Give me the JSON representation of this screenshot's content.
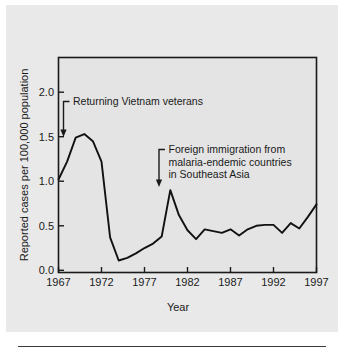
{
  "figure": {
    "background_color": "#e9e9e9",
    "plot_background_color": "#e4e4e4",
    "line_color": "#111111",
    "axis_color": "#1a1a1a"
  },
  "chart_data": {
    "type": "line",
    "title": "",
    "xlabel": "Year",
    "ylabel": "Reported cases per 100,000 population",
    "xlim": [
      1967,
      1997
    ],
    "ylim": [
      0.0,
      2.35
    ],
    "grid": false,
    "legend": null,
    "xticks": [
      "1967",
      "1972",
      "1977",
      "1982",
      "1987",
      "1992",
      "1997"
    ],
    "xtick_values": [
      1967,
      1972,
      1977,
      1982,
      1987,
      1992,
      1997
    ],
    "yticks": [
      "0.0",
      "0.5",
      "1.0",
      "1.5",
      "2.0"
    ],
    "ytick_values": [
      0.0,
      0.5,
      1.0,
      1.5,
      2.0
    ],
    "x": [
      1967,
      1968,
      1969,
      1970,
      1971,
      1972,
      1973,
      1974,
      1975,
      1976,
      1977,
      1978,
      1979,
      1980,
      1981,
      1982,
      1983,
      1984,
      1985,
      1986,
      1987,
      1988,
      1989,
      1990,
      1991,
      1992,
      1993,
      1994,
      1995,
      1996,
      1997
    ],
    "values": [
      1.02,
      1.22,
      1.49,
      1.53,
      1.45,
      1.22,
      0.37,
      0.11,
      0.14,
      0.19,
      0.25,
      0.3,
      0.38,
      0.9,
      0.62,
      0.45,
      0.35,
      0.46,
      0.44,
      0.42,
      0.46,
      0.39,
      0.46,
      0.5,
      0.51,
      0.51,
      0.42,
      0.53,
      0.47,
      0.6,
      0.74
    ],
    "annotations": [
      {
        "id": "returning-vietnam-veterans",
        "lines": [
          "Returning Vietnam veterans"
        ],
        "target_x": 1967.6,
        "target_y": 1.36
      },
      {
        "id": "foreign-immigration",
        "lines": [
          "Foreign immigration from",
          "malaria-endemic countries",
          "in Southeast Asia"
        ],
        "target_x": 1979.3,
        "target_y": 0.93
      }
    ]
  }
}
